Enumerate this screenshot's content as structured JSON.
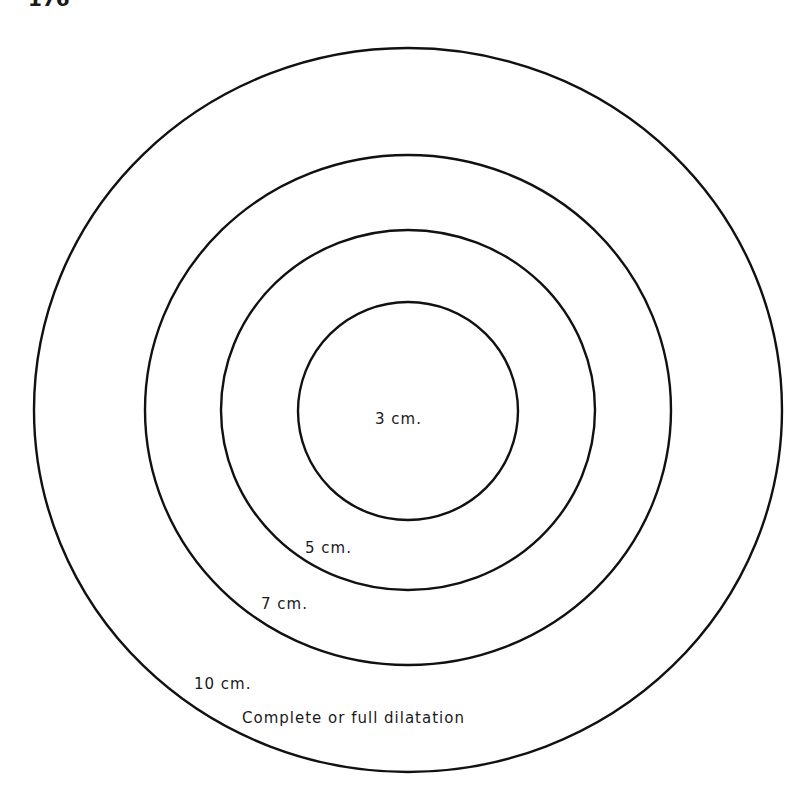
{
  "page": {
    "number_fragment": "176"
  },
  "diagram": {
    "rings": [
      {
        "label": "10 cm.",
        "cx": 408,
        "cy": 410,
        "rx": 374,
        "ry": 362
      },
      {
        "label": "7 cm.",
        "cx": 408,
        "cy": 410,
        "rx": 263,
        "ry": 255
      },
      {
        "label": "5 cm.",
        "cx": 408,
        "cy": 410,
        "rx": 187,
        "ry": 180
      },
      {
        "label": "3 cm.",
        "cx": 408,
        "cy": 411,
        "rx": 110,
        "ry": 109
      }
    ],
    "labels": {
      "inner": "3 cm.",
      "ring2": "5 cm.",
      "ring3": "7 cm.",
      "outer": "10 cm.",
      "caption": "Complete or full dilatation"
    }
  }
}
